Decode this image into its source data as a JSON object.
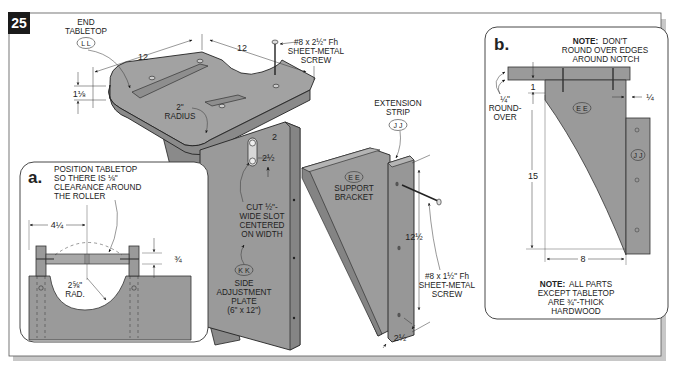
{
  "figure": {
    "number": "25",
    "colors": {
      "part_fill": "#9a9a9a",
      "part_fill_light": "#b0b0b0",
      "part_fill_dark": "#7e7e7e",
      "line": "#222222",
      "frame_shadow": "#c4c4c4",
      "badge_bg": "#1a1a1a",
      "badge_text": "#ffffff"
    }
  },
  "main_view": {
    "labels": {
      "end_tabletop": [
        "END",
        "TABLETOP"
      ],
      "end_tabletop_part": "L L",
      "top_screw": [
        "#8 x 2½\" Fh",
        "SHEET-METAL",
        "SCREW"
      ],
      "radius": [
        "2\"",
        "RADIUS"
      ],
      "extension_strip": [
        "EXTENSION",
        "STRIP"
      ],
      "extension_strip_part": "J J",
      "support_bracket_part": "E E",
      "support_bracket": [
        "SUPPORT",
        "BRACKET"
      ],
      "slot": [
        "CUT ½\"-",
        "WIDE SLOT",
        "CENTERED",
        "ON WIDTH"
      ],
      "side_plate_part": "K K",
      "side_plate": [
        "SIDE",
        "ADJUSTMENT",
        "PLATE",
        "(6\" x 12\")"
      ],
      "side_screw": [
        "#8 x 1½\" Fh",
        "SHEET-METAL",
        "SCREW"
      ]
    },
    "dimensions": {
      "tabletop_width_left": "12",
      "tabletop_width_right": "12",
      "tabletop_thickness": "1⅛",
      "slot_offset": "2",
      "slot_length": "2½",
      "bracket_height": "12½",
      "strip_width": "2½"
    }
  },
  "detail_a": {
    "letter": "a.",
    "note": [
      "POSITION TABLETOP",
      "SO THERE IS ⅛\"",
      "CLEARANCE AROUND",
      "THE ROLLER"
    ],
    "dimensions": {
      "offset": "4¼",
      "thickness": "¾",
      "radius": [
        "2⅝\"",
        "RAD."
      ]
    }
  },
  "detail_b": {
    "letter": "b.",
    "note_top_bold": "NOTE:",
    "note_top": [
      "DON'T",
      "ROUND OVER EDGES",
      "AROUND NOTCH"
    ],
    "roundover": [
      "¼\"",
      "ROUND-",
      "OVER"
    ],
    "part_bracket": "E E",
    "part_strip": "J J",
    "dimensions": {
      "top_gap": "1",
      "inset": "¼",
      "height": "15",
      "width": "8"
    },
    "note_bottom_bold": "NOTE:",
    "note_bottom": [
      "ALL PARTS",
      "EXCEPT TABLETOP",
      "ARE ¾\"-THICK",
      "HARDWOOD"
    ]
  }
}
